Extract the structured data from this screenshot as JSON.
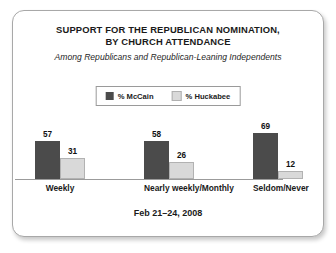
{
  "chart_data": {
    "type": "bar",
    "title": "SUPPORT FOR THE REPUBLICAN NOMINATION, BY CHURCH ATTENDANCE",
    "title_lines": [
      "SUPPORT FOR THE REPUBLICAN NOMINATION,",
      "BY CHURCH ATTENDANCE"
    ],
    "subtitle": "Among Republicans and Republican-Leaning Independents",
    "footnote": "Feb 21–24, 2008",
    "categories": [
      "Weekly",
      "Nearly weekly/Monthly",
      "Seldom/Never"
    ],
    "series": [
      {
        "name": "% McCain",
        "color": "#4b4b4b",
        "values": [
          57,
          58,
          69
        ]
      },
      {
        "name": "% Huckabee",
        "color": "#d9d9d9",
        "values": [
          31,
          26,
          12
        ]
      }
    ],
    "xlabel": "",
    "ylabel": "",
    "ylim": [
      0,
      80
    ],
    "grid": false,
    "legend_position": "top-center",
    "value_labels": true
  }
}
